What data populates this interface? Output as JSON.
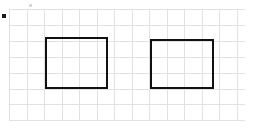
{
  "canvas": {
    "width": 256,
    "height": 128,
    "background_color": "#ffffff",
    "title": "grid-with-two-rectangles"
  },
  "grid": {
    "name": "graph-paper-grid",
    "line_color": "#e2e2e4",
    "line_width": 1,
    "x_start": 9,
    "y_start": 9,
    "x_end": 245,
    "y_end": 120,
    "cell_width": 17.5,
    "cell_height": 15.9,
    "columns": 14,
    "rows": 7,
    "visible": true
  },
  "shapes": [
    {
      "id": "rectangle-left",
      "name": "rectangle-left",
      "type": "rectangle",
      "stroke_color": "#111111",
      "stroke_width": 2,
      "fill": "none",
      "x": 45,
      "y": 37,
      "width": 63,
      "height": 52
    },
    {
      "id": "rectangle-right",
      "name": "rectangle-right",
      "type": "rectangle",
      "stroke_color": "#111111",
      "stroke_width": 2,
      "fill": "none",
      "x": 150,
      "y": 39,
      "width": 64,
      "height": 50
    }
  ],
  "markers": [
    {
      "id": "origin-dot",
      "name": "origin-dot-marker",
      "type": "square-dot",
      "color": "#1a1a1a",
      "x": 2,
      "y": 14,
      "size": 4
    }
  ],
  "faint_marks": [
    {
      "id": "top-tick",
      "name": "top-tick-mark",
      "color": "#d8d8dc",
      "x": 29,
      "y": 4,
      "width": 3,
      "height": 3
    }
  ]
}
